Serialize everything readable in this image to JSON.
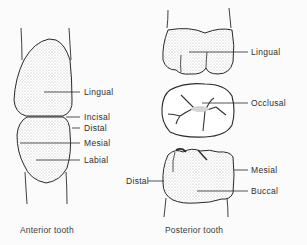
{
  "anterior": {
    "caption": "Anterior tooth",
    "labels": {
      "lingual": "Lingual",
      "incisal": "Incisal",
      "distal": "Distal",
      "mesial": "Mesial",
      "labial": "Labial"
    }
  },
  "posterior": {
    "caption": "Posterior tooth",
    "labels": {
      "lingual": "Lingual",
      "occlusal": "Occlusal",
      "distal": "Distal",
      "mesial": "Mesial",
      "buccal": "Buccal"
    }
  },
  "colors": {
    "ink": "#2a2a2a",
    "background": "#fbfbfb"
  }
}
